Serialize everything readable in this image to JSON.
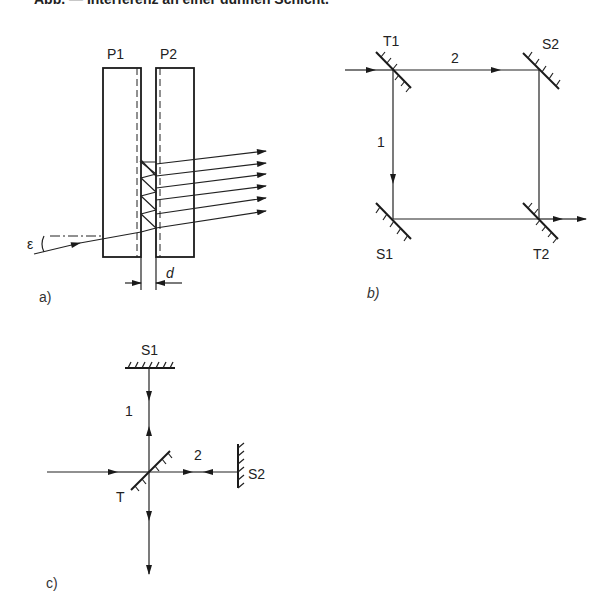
{
  "header": {
    "text": "Abb. — Interferenz an einer dünnen Schicht."
  },
  "panel_a": {
    "label": "a)",
    "plate1_label": "P1",
    "plate2_label": "P2",
    "angle_label": "ε",
    "gap_label": "d",
    "output_ray_count": 6
  },
  "panel_b": {
    "label": "b)",
    "beamsplitter1_label": "T1",
    "beamsplitter2_label": "T2",
    "mirror1_label": "S1",
    "mirror2_label": "S2",
    "path1_label": "1",
    "path2_label": "2"
  },
  "panel_c": {
    "label": "c)",
    "beamsplitter_label": "T",
    "mirror1_label": "S1",
    "mirror2_label": "S2",
    "path1_label": "1",
    "path2_label": "2"
  },
  "colors": {
    "ink": "#1a1a1a",
    "background": "#ffffff"
  }
}
